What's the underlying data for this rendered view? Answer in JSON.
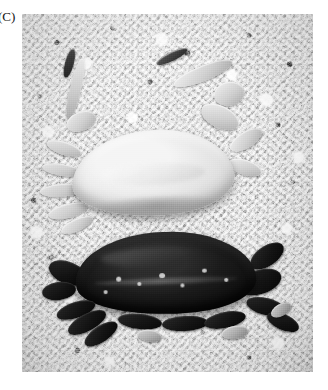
{
  "figure": {
    "panel_label": "(C)",
    "caption_text": "",
    "medium": "black-and-white photograph",
    "colors": {
      "page_background": "#ffffff",
      "label_text": "#141414",
      "substrate_light": "#e4e4e4",
      "substrate_mid": "#d2d2d2",
      "substrate_shadow": "#1a1a1a",
      "pale_crab": "#e9e9e6",
      "pale_crab_shadow": "#a9a9a4",
      "dark_crab": "#151513",
      "dark_crab_highlight": "#2e2e2c"
    },
    "photo_frame": {
      "left": 22,
      "top": 14,
      "width": 291,
      "height": 358
    },
    "specimens": [
      {
        "id": "pale-crab",
        "position": "upper",
        "tone": "pale / light cream-white carapace",
        "carapace_shape": "broad transversely oval",
        "appendages": "chelipeds raised upper-left and upper-right; walking legs fanned to the left"
      },
      {
        "id": "dark-crab",
        "position": "lower",
        "tone": "very dark / near-black carapace with glossy highlights",
        "carapace_shape": "broad transversely oval",
        "appendages": "chelipeds to lower-left and right; pale-tipped walking legs along the lower margin"
      }
    ]
  }
}
